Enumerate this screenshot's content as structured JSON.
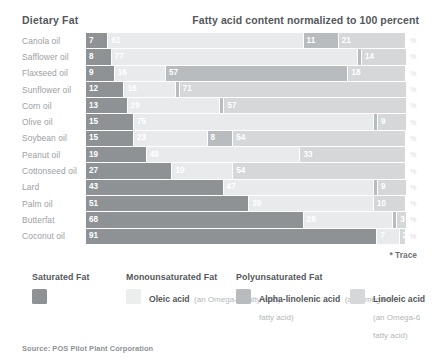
{
  "header": {
    "left_title": "Dietary Fat",
    "right_title": "Fatty acid content normalized to 100 percent"
  },
  "trace_note": "* Trace",
  "source": "Source: POS Pilot Plant Corporation",
  "legend": {
    "groups": [
      {
        "title": "Saturated Fat"
      },
      {
        "title": "Monounsaturated Fat"
      },
      {
        "title": "Polyunsaturated Fat"
      }
    ],
    "items": [
      {
        "name": "",
        "sub1": "",
        "sub2": "",
        "swatch": "saturated",
        "color": "#8e9295"
      },
      {
        "name": "Oleic acid",
        "sub1": "(an Omega-9",
        "sub2": "fatty acid)",
        "swatch": "oleic",
        "color": "#eceded"
      },
      {
        "name": "Alpha-linolenic acid",
        "sub1": "(an Omega-3",
        "sub2": "fatty acid)",
        "swatch": "alpha-linolenic",
        "color": "#b9bcbe"
      },
      {
        "name": "Linoleic acid",
        "sub1": "(an Omega-6",
        "sub2": "fatty acid)",
        "swatch": "linoleic",
        "color": "#d5d7d8"
      }
    ]
  },
  "row_suffix": "%",
  "chart_data": {
    "type": "bar",
    "orientation": "horizontal",
    "stacked": true,
    "normalized_to": 100,
    "title": "Fatty acid content normalized to 100 percent",
    "xlabel": "",
    "ylabel": "Dietary Fat",
    "xlim": [
      0,
      100
    ],
    "grid": false,
    "legend_position": "bottom",
    "annotations": [
      "* Trace"
    ],
    "categories": [
      "Canola oil",
      "Safflower oil",
      "Flaxseed oil",
      "Sunflower oil",
      "Corn oil",
      "Olive oil",
      "Soybean oil",
      "Peanut oil",
      "Cottonseed oil",
      "Lard",
      "Palm oil",
      "Butterfat",
      "Coconut oil"
    ],
    "series": [
      {
        "name": "Saturated Fat",
        "color": "#8e9295",
        "values": [
          7,
          8,
          9,
          12,
          13,
          15,
          15,
          19,
          27,
          43,
          51,
          68,
          91
        ]
      },
      {
        "name": "Oleic acid",
        "color": "#eceded",
        "values": [
          61,
          77,
          16,
          16,
          29,
          75,
          23,
          48,
          19,
          47,
          39,
          28,
          7
        ]
      },
      {
        "name": "Alpha-linolenic acid",
        "color": "#b9bcbe",
        "values": [
          11,
          1,
          57,
          1,
          1,
          1,
          8,
          0,
          0,
          1,
          0,
          1,
          0
        ]
      },
      {
        "name": "Linoleic acid",
        "color": "#d5d7d8",
        "values": [
          21,
          14,
          18,
          71,
          57,
          9,
          54,
          33,
          54,
          9,
          10,
          3,
          2
        ]
      }
    ],
    "labels": [
      {
        "category": "Canola oil",
        "saturated": "7",
        "oleic": "61",
        "ala": "11",
        "linoleic": "21"
      },
      {
        "category": "Safflower oil",
        "saturated": "8",
        "oleic": "77",
        "ala": "1",
        "linoleic": "14"
      },
      {
        "category": "Flaxseed oil",
        "saturated": "9",
        "oleic": "16",
        "ala": "57",
        "linoleic": "18"
      },
      {
        "category": "Sunflower oil",
        "saturated": "12",
        "oleic": "16",
        "ala": "1",
        "linoleic": "71"
      },
      {
        "category": "Corn oil",
        "saturated": "13",
        "oleic": "29",
        "ala": "1",
        "linoleic": "57"
      },
      {
        "category": "Olive oil",
        "saturated": "15",
        "oleic": "75",
        "ala": "1",
        "linoleic": "9"
      },
      {
        "category": "Soybean oil",
        "saturated": "15",
        "oleic": "23",
        "ala": "8",
        "linoleic": "54"
      },
      {
        "category": "Peanut oil",
        "saturated": "19",
        "oleic": "48",
        "ala": "*",
        "linoleic": "33"
      },
      {
        "category": "Cottonseed oil",
        "saturated": "27",
        "oleic": "19",
        "ala": "*",
        "linoleic": "54"
      },
      {
        "category": "Lard",
        "saturated": "43",
        "oleic": "47",
        "ala": "1",
        "linoleic": "9"
      },
      {
        "category": "Palm oil",
        "saturated": "51",
        "oleic": "39",
        "ala": "*",
        "linoleic": "10"
      },
      {
        "category": "Butterfat",
        "saturated": "68",
        "oleic": "28",
        "ala": "1",
        "linoleic": "3"
      },
      {
        "category": "Coconut oil",
        "saturated": "91",
        "oleic": "7",
        "ala": "*",
        "linoleic": "2"
      }
    ]
  }
}
